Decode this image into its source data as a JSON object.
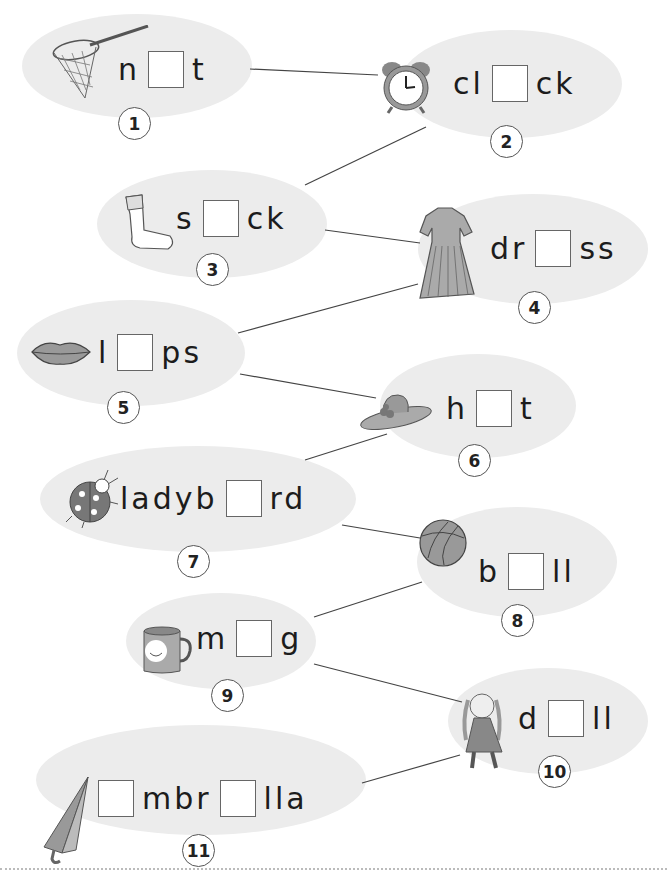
{
  "worksheet": {
    "items": [
      {
        "number": "1",
        "picture": "net-icon",
        "parts": [
          "n",
          "_",
          "t"
        ]
      },
      {
        "number": "2",
        "picture": "alarm-clock-icon",
        "parts": [
          "cl",
          "_",
          "ck"
        ]
      },
      {
        "number": "3",
        "picture": "sock-icon",
        "parts": [
          "s",
          "_",
          "ck"
        ]
      },
      {
        "number": "4",
        "picture": "dress-icon",
        "parts": [
          "dr",
          "_",
          "ss"
        ]
      },
      {
        "number": "5",
        "picture": "lips-icon",
        "parts": [
          "l",
          "_",
          "ps"
        ]
      },
      {
        "number": "6",
        "picture": "hat-icon",
        "parts": [
          "h",
          "_",
          "t"
        ]
      },
      {
        "number": "7",
        "picture": "ladybird-icon",
        "parts": [
          "ladyb",
          "_",
          "rd"
        ]
      },
      {
        "number": "8",
        "picture": "ball-icon",
        "parts": [
          "b",
          "_",
          "ll"
        ]
      },
      {
        "number": "9",
        "picture": "mug-icon",
        "parts": [
          "m",
          "_",
          "g"
        ]
      },
      {
        "number": "10",
        "picture": "doll-icon",
        "parts": [
          "d",
          "_",
          "ll"
        ]
      },
      {
        "number": "11",
        "picture": "umbrella-icon",
        "parts": [
          "_",
          "mbr",
          "_",
          "lla"
        ]
      }
    ]
  },
  "text": {
    "w1a": "n",
    "w1b": "t",
    "w2a": "cl",
    "w2b": "ck",
    "w3a": "s",
    "w3b": "ck",
    "w4a": "dr",
    "w4b": "ss",
    "w5a": "l",
    "w5b": "ps",
    "w6a": "h",
    "w6b": "t",
    "w7a": "ladyb",
    "w7b": "rd",
    "w8a": "b",
    "w8b": "ll",
    "w9a": "m",
    "w9b": "g",
    "w10a": "d",
    "w10b": "ll",
    "w11a": "mbr",
    "w11b": "lla",
    "n1": "1",
    "n2": "2",
    "n3": "3",
    "n4": "4",
    "n5": "5",
    "n6": "6",
    "n7": "7",
    "n8": "8",
    "n9": "9",
    "n10": "10",
    "n11": "11"
  },
  "colors": {
    "bubble": "#ececec",
    "line": "#444444",
    "ink": "#1c1c1c"
  }
}
